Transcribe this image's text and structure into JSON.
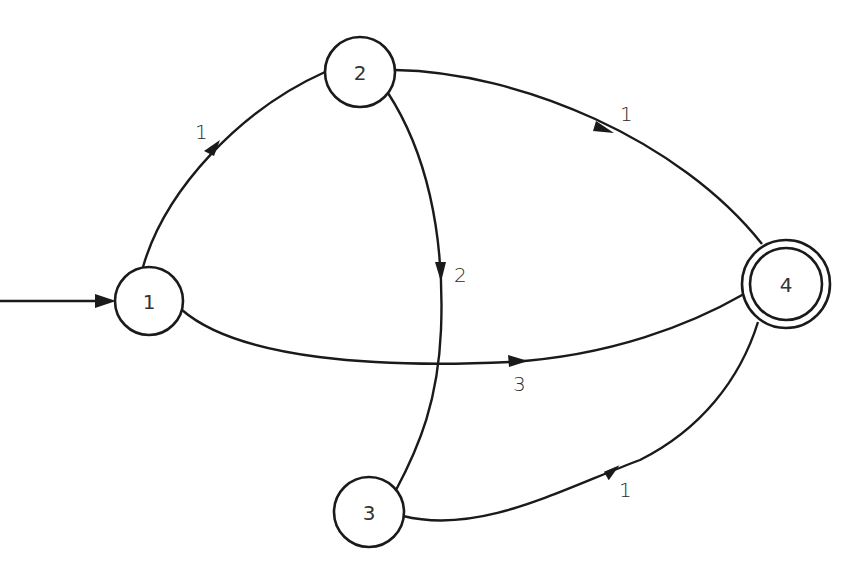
{
  "diagram": {
    "type": "state-transition-graph",
    "nodes": [
      {
        "id": "1",
        "label": "1",
        "initial": true,
        "accepting": false
      },
      {
        "id": "2",
        "label": "2",
        "initial": false,
        "accepting": false
      },
      {
        "id": "3",
        "label": "3",
        "initial": false,
        "accepting": false
      },
      {
        "id": "4",
        "label": "4",
        "initial": false,
        "accepting": true
      }
    ],
    "edges": [
      {
        "from": "1",
        "to": "2",
        "label": "1"
      },
      {
        "from": "2",
        "to": "4",
        "label": "1"
      },
      {
        "from": "2",
        "to": "3",
        "label": "2"
      },
      {
        "from": "1",
        "to": "4",
        "label": "3"
      },
      {
        "from": "3",
        "to": "4",
        "label": "1"
      }
    ],
    "start_arrow": {
      "to": "1",
      "label": ""
    },
    "colors": {
      "stroke": "#1a1a1a",
      "background": "#ffffff",
      "text": "#333333"
    }
  }
}
